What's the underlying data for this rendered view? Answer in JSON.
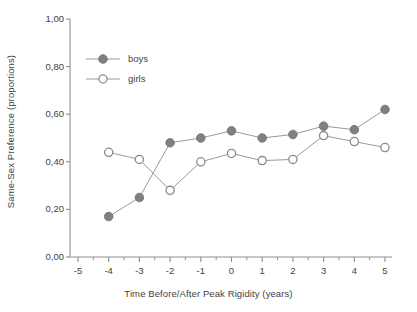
{
  "chart_data": {
    "type": "line",
    "title": "",
    "subtitle": "",
    "xlabel": "Time Before/After Peak Rigidity (years)",
    "ylabel": "Same-Sex Preference (proportions)",
    "xlim": [
      -5,
      5
    ],
    "ylim": [
      0.0,
      1.0
    ],
    "grid": false,
    "legend_position": "top-left-inside",
    "x_tick_labels": [
      "-5",
      "-4",
      "-3",
      "-2",
      "-1",
      "0",
      "1",
      "2",
      "3",
      "4",
      "5"
    ],
    "x_tick_values": [
      -5,
      -4,
      -3,
      -2,
      -1,
      0,
      1,
      2,
      3,
      4,
      5
    ],
    "y_tick_labels": [
      "0,00",
      "0,20",
      "0,40",
      "0,60",
      "0,80",
      "1,00"
    ],
    "y_tick_values": [
      0.0,
      0.2,
      0.4,
      0.6,
      0.8,
      1.0
    ],
    "x": [
      -4,
      -3,
      -2,
      -1,
      0,
      1,
      2,
      3,
      4,
      5
    ],
    "series": [
      {
        "name": "boys",
        "marker": "filled-circle",
        "color": "#808080",
        "values": [
          0.17,
          0.25,
          0.48,
          0.5,
          0.53,
          0.5,
          0.515,
          0.55,
          0.535,
          0.62
        ]
      },
      {
        "name": "girls",
        "marker": "open-circle",
        "color": "#ffffff",
        "edge_color": "#8a8a8a",
        "values": [
          0.44,
          0.41,
          0.28,
          0.4,
          0.435,
          0.405,
          0.41,
          0.51,
          0.485,
          0.46
        ]
      }
    ]
  },
  "legend": {
    "entries": [
      {
        "label": "boys"
      },
      {
        "label": "girls"
      }
    ]
  },
  "colors": {
    "axis": "#8f8f8f",
    "line": "#9a9a9a",
    "boys_marker": "#808080",
    "girls_marker_fill": "#ffffff",
    "girls_marker_edge": "#8a8a8a",
    "text": "#3f3f3f",
    "background": "#ffffff"
  }
}
